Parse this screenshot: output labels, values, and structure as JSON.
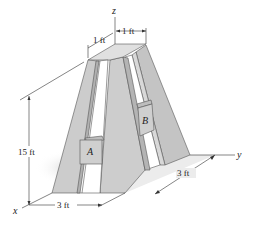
{
  "figure": {
    "axes": {
      "x": "x",
      "y": "y",
      "z": "z"
    },
    "dimensions": {
      "top_width_left": "1 ft",
      "top_width_right": "1 ft",
      "height": "15 ft",
      "base_width_x": "3 ft",
      "base_width_y": "3 ft"
    },
    "blocks": {
      "a": "A",
      "b": "B"
    },
    "colors": {
      "leg_light": "#d4d4d4",
      "leg_dark": "#b8b8b8",
      "block": "#cfcfcf",
      "shadow": "#e2e2e2"
    }
  }
}
